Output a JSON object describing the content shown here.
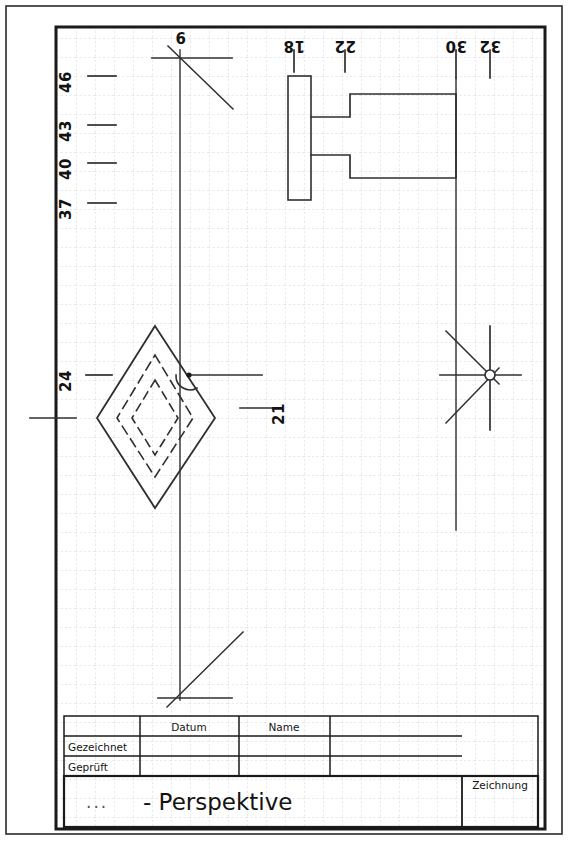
{
  "sheet": {
    "width": 568,
    "height": 844,
    "background": "#ffffff",
    "ink": "#131313",
    "grid_color": "#cfcfd6",
    "grid_spacing": 19
  },
  "drawing": {
    "title": "- Perspektive",
    "kind": "technical-drawing",
    "dimension_labels": {
      "left_axis": [
        {
          "value": "46",
          "y": 76
        },
        {
          "value": "43",
          "y": 125
        },
        {
          "value": "40",
          "y": 163
        },
        {
          "value": "37",
          "y": 203
        },
        {
          "value": "24",
          "y": 375
        }
      ],
      "top_axis": [
        {
          "value": "6",
          "x": 180
        },
        {
          "value": "18",
          "x": 294
        },
        {
          "value": "22",
          "x": 345
        },
        {
          "value": "30",
          "x": 456
        },
        {
          "value": "32",
          "x": 490
        }
      ],
      "callouts": [
        {
          "value": "21",
          "x": 284,
          "y": 408
        }
      ]
    }
  },
  "title_block": {
    "columns": {
      "datum": "Datum",
      "name": "Name"
    },
    "rows": [
      {
        "label": "Gezeichnet",
        "datum": "",
        "name": ""
      },
      {
        "label": "Geprüft",
        "datum": "",
        "name": ""
      }
    ],
    "prefix": "...",
    "main_title": "- Perspektive",
    "drawing_label": "Zeichnung"
  }
}
